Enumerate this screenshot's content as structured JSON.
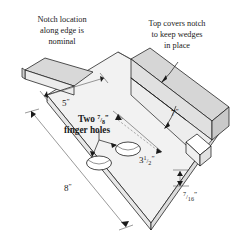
{
  "figure": {
    "background_color": "#ffffff",
    "line_color": "#1a1a1a",
    "board_face_color": "#f2f2f2",
    "rail_top_color": "#d6d6d6",
    "rail_side_color": "#c9c9c9",
    "edge_color": "#e4e4e4"
  },
  "callouts": {
    "notch_location": {
      "line1": "Notch location",
      "line2": "along edge is",
      "line3": "nominal"
    },
    "top_covers": {
      "line1": "Top covers notch",
      "line2": "to keep wedges",
      "line3": "in place"
    },
    "finger_holes": {
      "line1_pre": "Two ",
      "line1_num": "7",
      "line1_den": "8",
      "line1_inch": "”",
      "line2": "finger holes"
    }
  },
  "dimensions": {
    "width_5": {
      "value": "5",
      "unit": "”"
    },
    "length_8": {
      "value": "8",
      "unit": "”"
    },
    "rail_7": {
      "value": "7",
      "unit": "”"
    },
    "depth_3_half": {
      "whole": "3",
      "num": "1",
      "den": "2",
      "unit": "”"
    },
    "thickness_7_16": {
      "num": "7",
      "den": "16",
      "unit": "”"
    }
  }
}
